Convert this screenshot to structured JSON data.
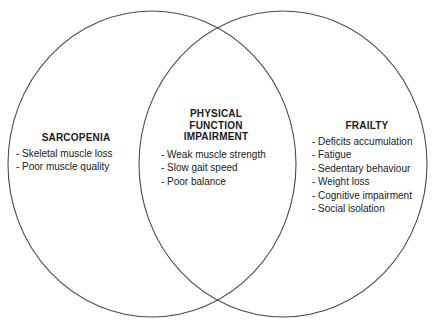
{
  "canvas": {
    "width": 437,
    "height": 333,
    "background_color": "#ffffff",
    "stroke_color": "#4a4a52",
    "text_color": "#1a1a1a"
  },
  "diagram": {
    "type": "venn",
    "set_count": 2,
    "ellipses": [
      {
        "name": "sarcopenia-ellipse",
        "cx": 152,
        "cy": 164,
        "rx": 144,
        "ry": 153
      },
      {
        "name": "frailty-ellipse",
        "cx": 283,
        "cy": 164,
        "rx": 144,
        "ry": 153
      }
    ]
  },
  "regions": {
    "left": {
      "heading": "SARCOPENIA",
      "items": [
        "Skeletal muscle loss",
        "Poor muscle quality"
      ]
    },
    "center": {
      "heading": "PHYSICAL\nFUNCTION\nIMPAIRMENT",
      "items": [
        "Weak muscle strength",
        "Slow gait speed",
        "Poor balance"
      ]
    },
    "right": {
      "heading": "FRAILTY",
      "items": [
        "Deficits accumulation",
        "Fatigue",
        "Sedentary behaviour",
        "Weight loss",
        "Cognitive impairment",
        "Social isolation"
      ]
    }
  },
  "bullet": {
    "dash": "-"
  }
}
